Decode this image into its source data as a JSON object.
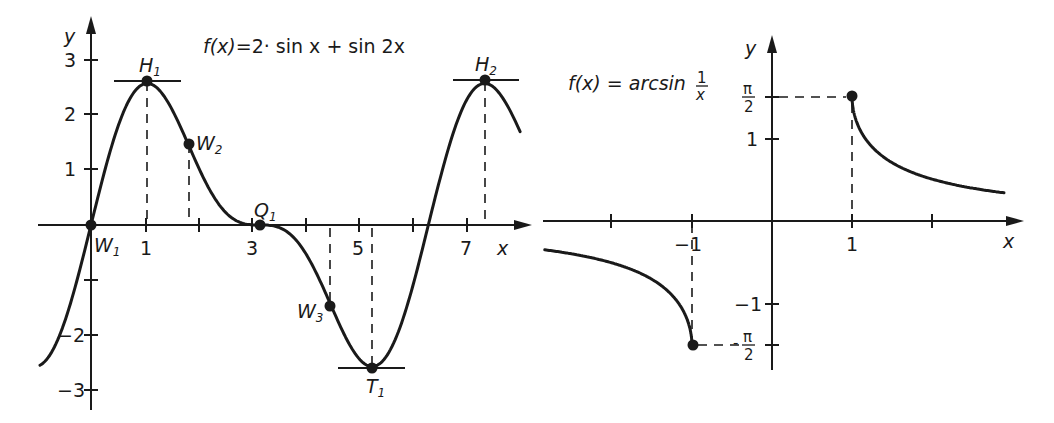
{
  "chart_data": [
    {
      "type": "line",
      "title": "f(x)=2· sin x + sin 2x",
      "title_parts": {
        "lhs": "f(x)",
        "rhs": "=2· sin x + sin 2x"
      },
      "xlabel": "x",
      "ylabel": "y",
      "xlim": [
        -1.15,
        8.0
      ],
      "ylim": [
        -3.3,
        3.3
      ],
      "x_ticks": [
        1,
        2,
        3,
        4,
        5,
        6,
        7
      ],
      "x_tick_labels": {
        "1": "1",
        "3": "3",
        "5": "5",
        "7": "7"
      },
      "y_ticks": [
        -3,
        -2,
        -1,
        1,
        2,
        3
      ],
      "y_tick_labels": {
        "-3": "-3",
        "-2": "-2",
        "1": "1",
        "2": "2",
        "3": "3"
      },
      "grid": false,
      "series": [
        {
          "name": "f(x)=2·sin x+sin 2x",
          "x_range": [
            -0.95,
            7.99
          ],
          "formula": "2*sin(x)+sin(2*x)"
        }
      ],
      "points": [
        {
          "name": "W1",
          "label": "W",
          "sub": "1",
          "x": 0,
          "y": 0,
          "kind": "inflection"
        },
        {
          "name": "H1",
          "label": "H",
          "sub": "1",
          "x": 1.047,
          "y": 2.598,
          "kind": "maximum"
        },
        {
          "name": "W2",
          "label": "W",
          "sub": "2",
          "x": 1.823,
          "y": 1.452,
          "kind": "inflection"
        },
        {
          "name": "Q1",
          "label": "Q",
          "sub": "1",
          "x": 3.1416,
          "y": 0,
          "kind": "saddle"
        },
        {
          "name": "W3",
          "label": "W",
          "sub": "3",
          "x": 4.46,
          "y": -1.452,
          "kind": "inflection"
        },
        {
          "name": "T1",
          "label": "T",
          "sub": "1",
          "x": 5.236,
          "y": -2.598,
          "kind": "minimum"
        },
        {
          "name": "H2",
          "label": "H",
          "sub": "2",
          "x": 7.33,
          "y": 2.598,
          "kind": "maximum"
        }
      ]
    },
    {
      "type": "line",
      "title": "f(x) = arcsin 1/x",
      "title_parts": {
        "lhs": "f(x) = arcsin",
        "num": "1",
        "den": "x"
      },
      "xlabel": "x",
      "ylabel": "y",
      "xlim": [
        -2.85,
        3.15
      ],
      "ylim": [
        -1.9,
        2.3
      ],
      "x_ticks": [
        -2,
        -1,
        1,
        2
      ],
      "x_tick_labels": {
        "-1": "-1",
        "1": "1"
      },
      "y_ticks": [
        -1.5708,
        -1,
        1,
        1.5708
      ],
      "y_tick_labels": {
        "pi_half": "π/2",
        "one": "1",
        "neg_one": "-1",
        "neg_pi_half": "-π/2"
      },
      "grid": false,
      "series": [
        {
          "name": "right branch",
          "x_range": [
            1,
            2.9
          ],
          "formula": "asin(1/x)"
        },
        {
          "name": "left branch",
          "x_range": [
            -2.84,
            -1
          ],
          "formula": "asin(1/x)"
        }
      ],
      "points": [
        {
          "name": "endpoint-right",
          "x": 1,
          "y": 1.5708
        },
        {
          "name": "endpoint-left",
          "x": -1,
          "y": -1.5708
        }
      ]
    }
  ],
  "left": {
    "title_lhs": "f(x)",
    "title_rhs": "=2· sin x + sin 2x",
    "axis_x": "x",
    "axis_y": "y",
    "xt1": "1",
    "xt3": "3",
    "xt5": "5",
    "xt7": "7",
    "yt3": "3",
    "yt2": "2",
    "yt1": "1",
    "ytm2": "−2",
    "ytm3": "−3",
    "H": "H",
    "W": "W",
    "Q": "Q",
    "T": "T",
    "s1": "1",
    "s2": "2",
    "s3": "3"
  },
  "right": {
    "title_lhs": "f(x) = arcsin",
    "title_num": "1",
    "title_den": "x",
    "axis_x": "x",
    "axis_y": "y",
    "xtm1": "−1",
    "xt1": "1",
    "pi": "π",
    "two": "2",
    "yt1": "1",
    "ytm1": "−1",
    "minus": "-"
  }
}
